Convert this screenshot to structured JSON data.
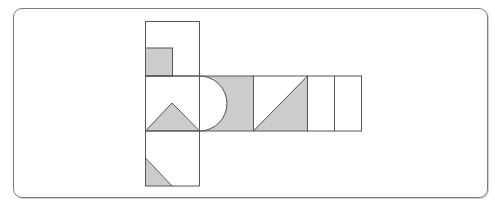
{
  "figure": {
    "stroke_color": "#555555",
    "shade_color": "#cccccc",
    "background": "#ffffff",
    "frame_color": "#7a7a7a",
    "unit": 54,
    "squares": [
      {
        "id": "top",
        "x": 145,
        "y": 21,
        "pattern": "small-square-bottom-left"
      },
      {
        "id": "middle-left",
        "x": 145,
        "y": 76,
        "pattern": "triangle-bottom"
      },
      {
        "id": "middle-2",
        "x": 199,
        "y": 76,
        "pattern": "semicircle-left-cutout"
      },
      {
        "id": "middle-3",
        "x": 253,
        "y": 76,
        "pattern": "diagonal-triangle"
      },
      {
        "id": "middle-4",
        "x": 307,
        "y": 76,
        "pattern": "split-vertical-blank"
      },
      {
        "id": "bottom",
        "x": 145,
        "y": 131,
        "pattern": "corner-triangle-bottom-left"
      }
    ]
  }
}
